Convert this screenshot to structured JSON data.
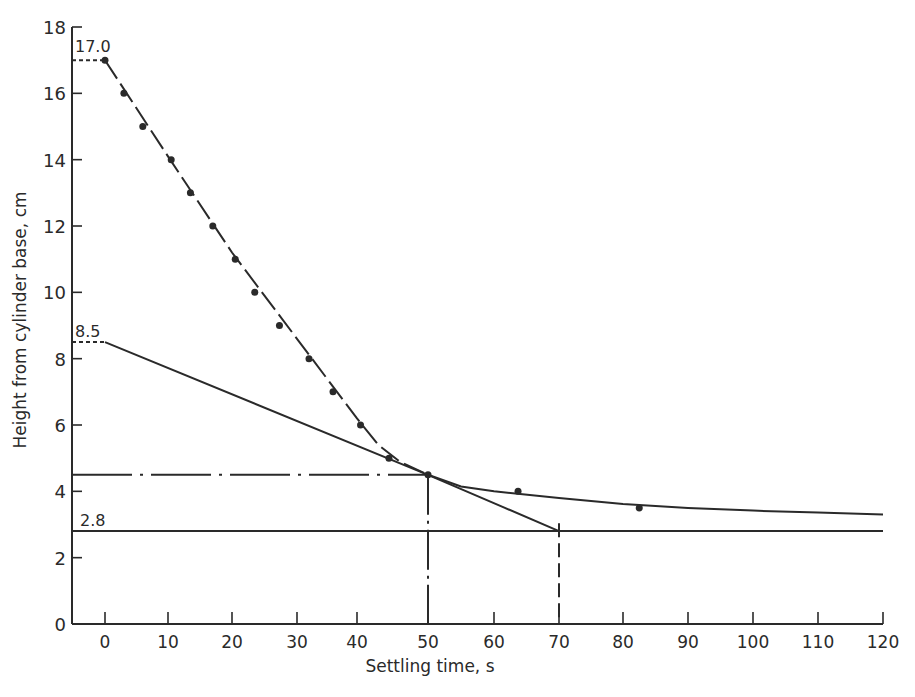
{
  "chart_data": {
    "type": "line",
    "title": "",
    "xlabel": "Settling time, s",
    "ylabel": "Height from cylinder base, cm",
    "xlim": [
      -5,
      120
    ],
    "ylim": [
      0,
      18
    ],
    "grid": false,
    "x_ticks": [
      0,
      10,
      20,
      30,
      40,
      50,
      60,
      70,
      80,
      90,
      100,
      110,
      120
    ],
    "y_ticks": [
      0,
      2,
      4,
      6,
      8,
      10,
      12,
      14,
      16,
      18
    ],
    "series": [
      {
        "name": "Measured interface height",
        "style": "points",
        "x": [
          0,
          3,
          6,
          10.5,
          13.5,
          17,
          20.5,
          23.5,
          27.3,
          32,
          36,
          40.5,
          44.5,
          50,
          63.7,
          82.5
        ],
        "y": [
          17.0,
          16.0,
          15.0,
          14.0,
          13.0,
          12.0,
          11.0,
          10.0,
          9.0,
          8.0,
          7.0,
          6.0,
          5.0,
          4.5,
          4.0,
          3.5
        ]
      },
      {
        "name": "Settling curve (long-dash)",
        "style": "long-dash",
        "x": [
          0,
          10,
          20,
          30,
          40,
          43,
          46,
          50
        ],
        "y": [
          17.0,
          14.1,
          11.2,
          8.6,
          6.2,
          5.4,
          4.9,
          4.5
        ]
      },
      {
        "name": "Compression curve (solid)",
        "style": "solid",
        "x": [
          50,
          55,
          60,
          70,
          80,
          90,
          100,
          110,
          120
        ],
        "y": [
          4.5,
          4.15,
          4.0,
          3.8,
          3.62,
          3.5,
          3.42,
          3.36,
          3.3
        ]
      },
      {
        "name": "Tangent from 8.5",
        "style": "solid",
        "x": [
          0,
          50,
          70
        ],
        "y": [
          8.5,
          4.5,
          2.8
        ]
      },
      {
        "name": "Ultimate height line",
        "style": "solid",
        "x": [
          -5,
          120
        ],
        "y": [
          2.8,
          2.8
        ]
      },
      {
        "name": "Critical height line",
        "style": "dash-dot",
        "x": [
          -5,
          50
        ],
        "y": [
          4.5,
          4.5
        ]
      }
    ],
    "annotations": [
      {
        "text": "17.0",
        "x": 0,
        "y": 17.0,
        "note": "initial height, dashed leader to y-axis"
      },
      {
        "text": "8.5",
        "x": 0,
        "y": 8.5,
        "note": "tangent intercept, dashed leader to y-axis"
      },
      {
        "text": "2.8",
        "x": 0,
        "y": 2.8,
        "note": "ultimate height"
      },
      {
        "text": "",
        "x": 50,
        "y": 4.5,
        "note": "dash-dot vertical drop at t=50"
      },
      {
        "text": "",
        "x": 70,
        "y": 2.8,
        "note": "dashed vertical drop at t=70"
      }
    ]
  },
  "labels": {
    "xlabel": "Settling time, s",
    "ylabel": "Height from cylinder base, cm",
    "ann_17": "17.0",
    "ann_85": "8.5",
    "ann_28": "2.8"
  }
}
